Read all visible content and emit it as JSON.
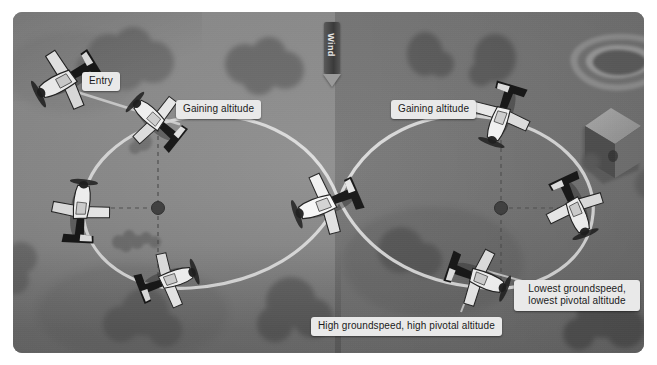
{
  "diagram": {
    "background_color": "#8c8c8c",
    "panel_color": "#8a8a8a",
    "path_color": "#e2e2e2",
    "label_bg": "#e9e9e9",
    "label_fg": "#1a1a1a"
  },
  "wind": {
    "label": "Wind",
    "direction": "down",
    "arrow_glyph": "▼"
  },
  "labels": [
    {
      "id": "entry",
      "text": "Entry",
      "x": 82,
      "y": 60,
      "lines": 1
    },
    {
      "id": "gaining-left",
      "text": "Gaining altitude",
      "x": 176,
      "y": 88,
      "lines": 1
    },
    {
      "id": "gaining-right",
      "text": "Gaining altitude",
      "x": 391,
      "y": 88,
      "lines": 1
    },
    {
      "id": "lowest-gs",
      "text": "Lowest groundspeed, lowest pivotal altitude",
      "x": 517,
      "y": 270,
      "lines": 2
    },
    {
      "id": "high-gs",
      "text": "High groundspeed, high pivotal altitude",
      "x": 312,
      "y": 305,
      "lines": 1
    }
  ],
  "label_text": {
    "entry": "Entry",
    "gaining_left": "Gaining altitude",
    "gaining_right": "Gaining altitude",
    "lowest_line1": "Lowest groundspeed,",
    "lowest_line2": "lowest pivotal altitude",
    "high": "High groundspeed, high pivotal altitude"
  },
  "pylons": [
    {
      "id": "left-pylon",
      "x": 145,
      "y": 196,
      "label": "left-pivot-point"
    },
    {
      "id": "right-pylon",
      "x": 488,
      "y": 196,
      "label": "right-pivot-point"
    }
  ],
  "aircraft": [
    {
      "id": "entry-aircraft",
      "x": 63,
      "y": 79,
      "rotation": -28,
      "scale": 1.0
    },
    {
      "id": "left-climb-aircraft",
      "x": 152,
      "y": 114,
      "rotation": 42,
      "scale": 0.92
    },
    {
      "id": "left-west-aircraft",
      "x": 78,
      "y": 203,
      "rotation": 96,
      "scale": 0.95
    },
    {
      "id": "left-south-aircraft",
      "x": 166,
      "y": 272,
      "rotation": 162,
      "scale": 0.92
    },
    {
      "id": "center-aircraft",
      "x": 325,
      "y": 196,
      "rotation": -20,
      "scale": 1.0
    },
    {
      "id": "right-climb-aircraft",
      "x": 498,
      "y": 110,
      "rotation": -70,
      "scale": 0.95
    },
    {
      "id": "right-east-aircraft",
      "x": 573,
      "y": 200,
      "rotation": -110,
      "scale": 0.95
    },
    {
      "id": "right-south-aircraft",
      "x": 478,
      "y": 272,
      "rotation": -160,
      "scale": 0.95
    }
  ],
  "terrain_features": [
    {
      "id": "pond",
      "name": "pond",
      "x": 565,
      "y": 48
    },
    {
      "id": "building",
      "name": "barn-building",
      "x": 598,
      "y": 126
    },
    {
      "id": "bush-cluster",
      "name": "bush-cluster",
      "x": 120,
      "y": 228
    }
  ]
}
